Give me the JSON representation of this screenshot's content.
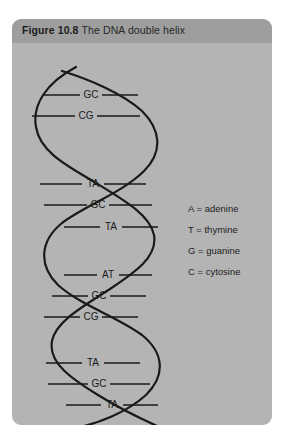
{
  "figure": {
    "number_label": "Figure 10.8",
    "caption": "The DNA double helix",
    "panel_bg": "#b4b4b4",
    "header_bg": "#9e9e9e",
    "stroke_color": "#1a1a1a"
  },
  "diagram": {
    "name": "dna-double-helix",
    "base_pairs": [
      {
        "index": 1,
        "label": "GC",
        "y": 52,
        "x_left": 26,
        "x_right": 120
      },
      {
        "index": 2,
        "label": "CG",
        "y": 73,
        "x_left": 14,
        "x_right": 122
      },
      {
        "index": 3,
        "label": "TA",
        "y": 141,
        "x_left": 22,
        "x_right": 128
      },
      {
        "index": 4,
        "label": "GC",
        "y": 162,
        "x_left": 26,
        "x_right": 134
      },
      {
        "index": 5,
        "label": "TA",
        "y": 184,
        "x_left": 46,
        "x_right": 140
      },
      {
        "index": 6,
        "label": "AT",
        "y": 232,
        "x_left": 46,
        "x_right": 134
      },
      {
        "index": 7,
        "label": "GC",
        "y": 253,
        "x_left": 34,
        "x_right": 128
      },
      {
        "index": 8,
        "label": "CG",
        "y": 274,
        "x_left": 26,
        "x_right": 120
      },
      {
        "index": 9,
        "label": "TA",
        "y": 320,
        "x_left": 28,
        "x_right": 122
      },
      {
        "index": 10,
        "label": "GC",
        "y": 341,
        "x_left": 30,
        "x_right": 132
      },
      {
        "index": 11,
        "label": "TA",
        "y": 362,
        "x_left": 48,
        "x_right": 140
      },
      {
        "index": 12,
        "label": "AT",
        "y": 412,
        "x_left": 54,
        "x_right": 146
      }
    ]
  },
  "legend": {
    "items": [
      {
        "symbol": "A",
        "name": "adenine",
        "text": "A = adenine"
      },
      {
        "symbol": "T",
        "name": "thymine",
        "text": "T = thymine"
      },
      {
        "symbol": "G",
        "name": "guanine",
        "text": "G = guanine"
      },
      {
        "symbol": "C",
        "name": "cytosine",
        "text": "C = cytosine"
      }
    ]
  }
}
